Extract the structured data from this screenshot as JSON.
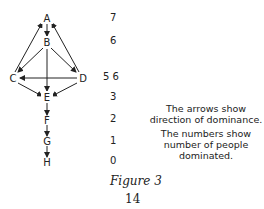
{
  "diagram": {
    "nodes": [
      {
        "id": "A",
        "label": "A",
        "dominates": "7"
      },
      {
        "id": "B",
        "label": "B",
        "dominates": "6"
      },
      {
        "id": "C",
        "label": "C",
        "dominates": "5"
      },
      {
        "id": "D",
        "label": "D",
        "dominates": "6"
      },
      {
        "id": "E",
        "label": "E",
        "dominates": "3"
      },
      {
        "id": "F",
        "label": "F",
        "dominates": "2"
      },
      {
        "id": "G",
        "label": "G",
        "dominates": "1"
      },
      {
        "id": "H",
        "label": "H",
        "dominates": "0"
      }
    ],
    "edges": [
      {
        "from": "A",
        "to": "B"
      },
      {
        "from": "C",
        "to": "A"
      },
      {
        "from": "D",
        "to": "A"
      },
      {
        "from": "B",
        "to": "C"
      },
      {
        "from": "B",
        "to": "D"
      },
      {
        "from": "B",
        "to": "E"
      },
      {
        "from": "D",
        "to": "C"
      },
      {
        "from": "C",
        "to": "E"
      },
      {
        "from": "D",
        "to": "E"
      },
      {
        "from": "E",
        "to": "F"
      },
      {
        "from": "F",
        "to": "G"
      },
      {
        "from": "G",
        "to": "H"
      }
    ],
    "levels": [
      "7",
      "6",
      "5 6",
      "3",
      "2",
      "1",
      "0"
    ]
  },
  "caption": {
    "line1": "The arrows show direction of dominance.",
    "line2": "The numbers show number of people dominated."
  },
  "figure_label": "Figure 3",
  "page_number": "14"
}
